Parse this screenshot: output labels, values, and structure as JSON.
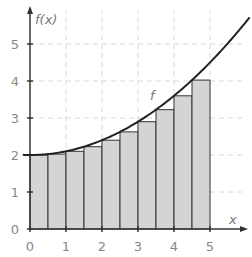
{
  "chart_data": {
    "type": "bar",
    "title": "",
    "xlabel": "x",
    "ylabel": "f(x)",
    "curve_label": "f",
    "xlim": [
      0,
      6.1
    ],
    "ylim": [
      0,
      5.7
    ],
    "x_ticks": [
      0,
      1,
      2,
      3,
      4,
      5
    ],
    "y_ticks": [
      0,
      1,
      2,
      3,
      4,
      5
    ],
    "grid": true,
    "bars": {
      "width": 0.5,
      "x_left": [
        0,
        0.5,
        1,
        1.5,
        2,
        2.5,
        3,
        3.5,
        4,
        4.5
      ],
      "heights": [
        2.0,
        2.025,
        2.1,
        2.225,
        2.4,
        2.625,
        2.9,
        3.225,
        3.6,
        4.025
      ],
      "fill": "#d4d4d4",
      "stroke": "#333333"
    },
    "series": [
      {
        "name": "f",
        "type": "line",
        "formula": "f(x) = 2 + 0.1x^2",
        "x": [
          -0.2,
          0,
          0.5,
          1,
          1.5,
          2,
          2.5,
          3,
          3.5,
          4,
          4.5,
          5,
          5.5,
          6.1
        ],
        "values": [
          2.004,
          2.0,
          2.025,
          2.1,
          2.225,
          2.4,
          2.625,
          2.9,
          3.225,
          3.6,
          4.025,
          4.5,
          5.025,
          5.721
        ],
        "color": "#222222"
      }
    ]
  },
  "labels": {
    "x_axis": "x",
    "y_axis": "f(x)",
    "curve": "f",
    "x_ticks": [
      "0",
      "1",
      "2",
      "3",
      "4",
      "5"
    ],
    "y_ticks": [
      "0",
      "1",
      "2",
      "3",
      "4",
      "5"
    ]
  }
}
